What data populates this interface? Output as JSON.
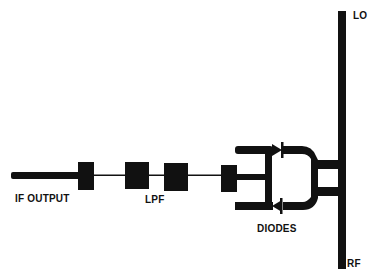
{
  "diagram": {
    "type": "mixer-schematic",
    "colors": {
      "ink": "#111111",
      "background": "#ffffff"
    },
    "labels": {
      "lo": "LO",
      "rf": "RF",
      "if_output": "IF OUTPUT",
      "lpf": "LPF",
      "diodes": "DIODES"
    },
    "components": [
      {
        "id": "if-output-line",
        "kind": "thick-transmission-line"
      },
      {
        "id": "lpf-section-1",
        "kind": "filter-block"
      },
      {
        "id": "lpf-section-2",
        "kind": "filter-block"
      },
      {
        "id": "lpf-section-3",
        "kind": "filter-block"
      },
      {
        "id": "lpf-section-4",
        "kind": "filter-block"
      },
      {
        "id": "diode-upper",
        "kind": "diode"
      },
      {
        "id": "diode-lower",
        "kind": "diode"
      },
      {
        "id": "lo-rf-line",
        "kind": "vertical-transmission-line"
      }
    ]
  }
}
